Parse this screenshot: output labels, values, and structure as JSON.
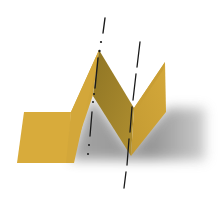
{
  "diagram": {
    "subject": "folded paper strip with fold axes",
    "colors": {
      "paper_light": "#d8ab3b",
      "paper_mid": "#c99e34",
      "paper_dark": "#9c7f2a",
      "shadow": "#8e8e8e",
      "axis_line": "#1a1a1a",
      "background": "#ffffff"
    },
    "elements": [
      {
        "name": "left-flat-panel",
        "label": "flat strip section"
      },
      {
        "name": "rising-face",
        "label": "face rising to peak fold"
      },
      {
        "name": "shaded-face",
        "label": "face descending to valley fold"
      },
      {
        "name": "right-face",
        "label": "face rising to right edge"
      },
      {
        "name": "cast-shadow",
        "label": "shadow"
      },
      {
        "name": "fold-axis-peak",
        "label": "dash-dot fold axis through peak"
      },
      {
        "name": "fold-axis-valley",
        "label": "dashed fold axis through valley"
      }
    ]
  }
}
